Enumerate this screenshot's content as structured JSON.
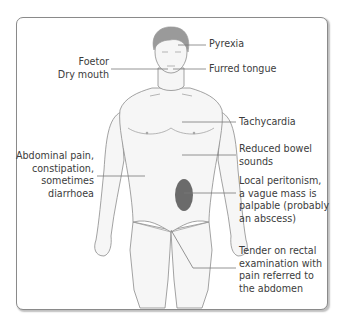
{
  "figure": {
    "colors": {
      "frame": "#8a8a8a",
      "body_outline": "#8c8c8c",
      "body_fill": "#f6f6f6",
      "hair": "#8f8f8f",
      "mass": "#6b6b6b",
      "leader": "#7a7a7a",
      "text": "#3c3c3c"
    },
    "labels": {
      "pyrexia": "Pyrexia",
      "foetor": "Foetor",
      "dry_mouth": "Dry mouth",
      "furred_tongue": "Furred tongue",
      "tachycardia": "Tachycardia",
      "reduced_bowel_1": "Reduced bowel",
      "reduced_bowel_2": "sounds",
      "abdominal_1": "Abdominal pain,",
      "abdominal_2": "constipation,",
      "abdominal_3": "sometimes",
      "abdominal_4": "diarrhoea",
      "peritonism_1": "Local peritonism,",
      "peritonism_2": "a vague mass is",
      "peritonism_3": "palpable (probably",
      "peritonism_4": "an abscess)",
      "rectal_1": "Tender on  rectal",
      "rectal_2": "examination with",
      "rectal_3": "pain referred to",
      "rectal_4": "the abdomen"
    }
  }
}
